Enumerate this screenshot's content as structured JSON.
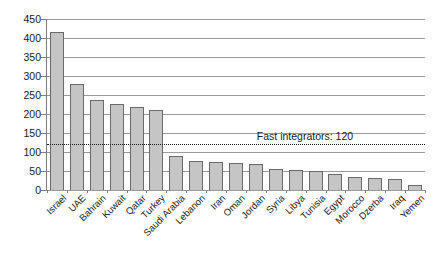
{
  "chart_data": {
    "type": "bar",
    "title": "",
    "xlabel": "",
    "ylabel": "",
    "categories": [
      "Israel",
      "UAE",
      "Bahrain",
      "Kuwait",
      "Qatar",
      "Turkey",
      "Saudi Arabia",
      "Lebanon",
      "Iran",
      "Oman",
      "Jordan",
      "Syria",
      "Libya",
      "Tunisia",
      "Egypt",
      "Morocco",
      "Dzerba",
      "Iraq",
      "Yemen"
    ],
    "values": [
      417,
      278,
      238,
      225,
      219,
      211,
      90,
      77,
      74,
      70,
      68,
      56,
      53,
      51,
      41,
      35,
      31,
      29,
      12
    ],
    "ylim": [
      0,
      450
    ],
    "ytick_step": 50,
    "ytick_labels": [
      "0",
      "50",
      "100",
      "150",
      "200",
      "250",
      "300",
      "350",
      "400",
      "450"
    ],
    "grid": true,
    "legend_position": "none",
    "annotation": {
      "text": "Fast integrators: 120",
      "y": 120,
      "line_style": "dotted"
    },
    "colors": {
      "background": "#ffffff",
      "bar_fill": "#c5c5c5",
      "bar_border": "#6a6a6a",
      "gridline": "#9a9a9a",
      "axis": "#7d7d7d",
      "annotation_line": "#1a1a1a",
      "text": "#1a1a1a"
    }
  }
}
